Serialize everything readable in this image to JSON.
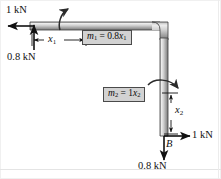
{
  "figure": {
    "type": "free-body-diagram",
    "width": 221,
    "height": 179,
    "background_color": "#ffffff",
    "member_fill_light": "#f2f2f2",
    "member_fill_dark": "#8c8c8c",
    "member_outline": "#3a3a3a",
    "annotation_color": "#111111",
    "label_box_fill": "#d2d2d2",
    "label_box_border": "#4a4a4a"
  },
  "labels": {
    "force_top_left": "1 kN",
    "force_top_up": "0.8 kN",
    "dimension_horizontal": "x",
    "dimension_horizontal_sub": "1",
    "dimension_vertical": "x",
    "dimension_vertical_sub": "2",
    "moment_top_box": "m",
    "moment_top_box_sub": "1",
    "moment_top_box_eq": " = 0.8",
    "moment_top_box_var": "x",
    "moment_top_box_var_sub": "1",
    "moment_bottom_box": "m",
    "moment_bottom_box_sub": "2",
    "moment_bottom_box_eq": " = 1",
    "moment_bottom_box_var": "x",
    "moment_bottom_box_var_sub": "2",
    "point_b": "B",
    "force_b_right": "1 kN",
    "force_b_down": "0.8 kN"
  }
}
